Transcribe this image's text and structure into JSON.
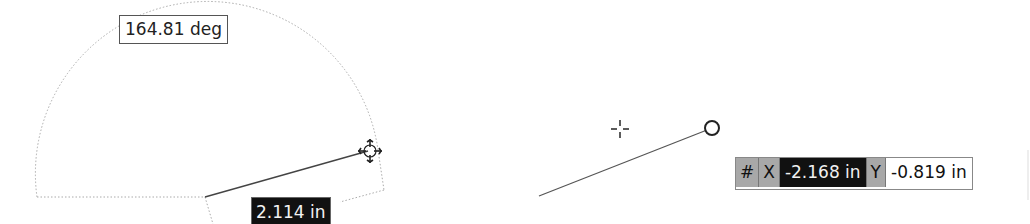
{
  "drawing": {
    "angle_dimension": {
      "value": "164.81 deg"
    },
    "length_dimension": {
      "value": "2.114 in"
    },
    "coordinate_input": {
      "hash_label": "#",
      "x_label": "X",
      "x_value": "-2.168 in",
      "y_label": "Y",
      "y_value": "-0.819 in"
    },
    "colors": {
      "line": "#444444",
      "dotted": "#aaaaaa",
      "active_field_bg": "#111111",
      "label_bg": "#a8a8a8"
    }
  }
}
